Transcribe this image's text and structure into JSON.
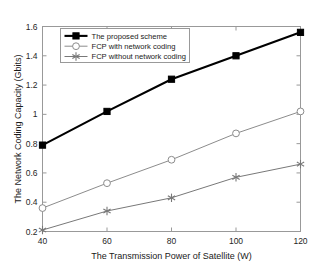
{
  "chart_data": {
    "type": "line",
    "title": "",
    "xlabel": "The Transmission Power of Satellite (W)",
    "ylabel": "The Network Coding Capacity (Gbits)",
    "x": [
      40,
      60,
      80,
      100,
      120
    ],
    "xticklabels": [
      "40",
      "60",
      "80",
      "100",
      "120"
    ],
    "yticklabels": [
      "0.2",
      "0.4",
      "0.6",
      "0.8",
      "1",
      "1.2",
      "1.4",
      "1.6"
    ],
    "yticks": [
      0.2,
      0.4,
      0.6,
      0.8,
      1.0,
      1.2,
      1.4,
      1.6
    ],
    "xlim": [
      40,
      120
    ],
    "ylim": [
      0.2,
      1.6
    ],
    "grid": false,
    "legend_position": "upper left inside",
    "series": [
      {
        "name": "The proposed scheme",
        "values": [
          0.79,
          1.02,
          1.24,
          1.4,
          1.56
        ],
        "color": "#000000",
        "marker": "square-filled",
        "linewidth": 2.1
      },
      {
        "name": "FCP with network coding",
        "values": [
          0.36,
          0.53,
          0.69,
          0.87,
          1.02
        ],
        "color": "#8c8c8c",
        "marker": "circle-open",
        "linewidth": 1.0
      },
      {
        "name": "FCP without network coding",
        "values": [
          0.21,
          0.34,
          0.43,
          0.57,
          0.66
        ],
        "color": "#787878",
        "marker": "star",
        "linewidth": 1.0
      }
    ]
  },
  "legend": {
    "entries": [
      "The proposed scheme",
      "FCP with network coding",
      "FCP without network coding"
    ]
  },
  "axes": {
    "frame_color": "#999999",
    "background": "#ffffff"
  }
}
